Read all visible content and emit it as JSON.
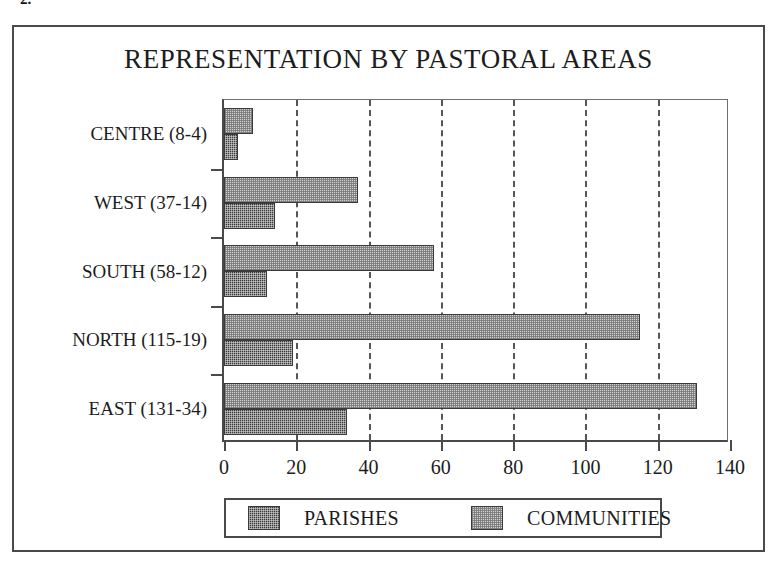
{
  "page_mark": "2.",
  "chart_data": {
    "type": "bar",
    "orientation": "horizontal",
    "title": "REPRESENTATION BY PASTORAL AREAS",
    "xlabel": "",
    "ylabel": "",
    "xlim": [
      0,
      140
    ],
    "ylim": null,
    "grid": "vertical-dashed",
    "legend_position": "bottom",
    "categories": [
      "CENTRE (8-4)",
      "WEST (37-14)",
      "SOUTH (58-12)",
      "NORTH (115-19)",
      "EAST (131-34)"
    ],
    "xticks": [
      0,
      20,
      40,
      60,
      80,
      100,
      120,
      140
    ],
    "xtick_labels": [
      "0",
      "20",
      "40",
      "60",
      "80",
      "100",
      "120",
      "140"
    ],
    "series": [
      {
        "name": "PARISHES",
        "color": "#3b3b3b",
        "pattern": "dark-checker",
        "values": [
          4,
          14,
          12,
          19,
          34
        ]
      },
      {
        "name": "COMMUNITIES",
        "color": "#d2d2d2",
        "pattern": "light-checker",
        "values": [
          8,
          37,
          58,
          115,
          131
        ]
      }
    ]
  },
  "legend": {
    "entries": [
      {
        "label": "PARISHES"
      },
      {
        "label": "COMMUNITIES"
      }
    ]
  }
}
